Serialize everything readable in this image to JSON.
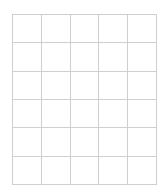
{
  "grid": {
    "columns": 5,
    "rows": 6,
    "line_color": "#cfcfcf",
    "background_color": "#ffffff",
    "cells": [
      [
        "",
        "",
        "",
        "",
        ""
      ],
      [
        "",
        "",
        "",
        "",
        ""
      ],
      [
        "",
        "",
        "",
        "",
        ""
      ],
      [
        "",
        "",
        "",
        "",
        ""
      ],
      [
        "",
        "",
        "",
        "",
        ""
      ],
      [
        "",
        "",
        "",
        "",
        ""
      ]
    ]
  }
}
